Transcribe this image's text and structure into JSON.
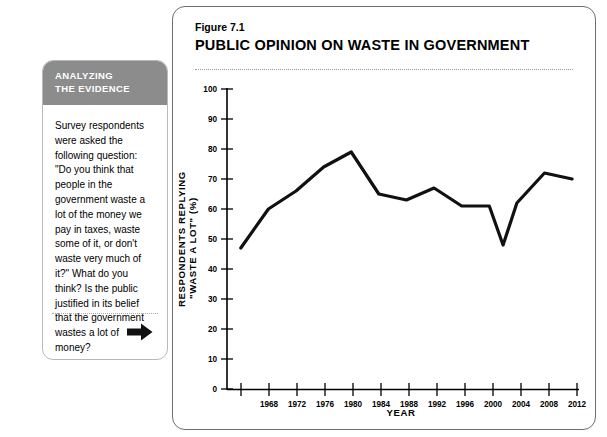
{
  "sidebar": {
    "header_line1": "ANALYZING",
    "header_line2": "THE EVIDENCE",
    "body": "Survey respondents were asked the following question: \"Do you think that people in the government waste a lot of the money we pay in taxes, waste some of it, or don't waste very much of it?\" What do you think? Is the public justified in its belief that the government wastes a lot of money?",
    "arrow_icon": "right-arrow-icon",
    "header_bg": "#8c8c8c",
    "border_color": "#b9b9b9"
  },
  "figure": {
    "number": "Figure 7.1",
    "title": "PUBLIC OPINION ON WASTE IN GOVERNMENT",
    "border_color": "#6e6e6e"
  },
  "chart_data": {
    "type": "line",
    "title": "PUBLIC OPINION ON WASTE IN GOVERNMENT",
    "xlabel": "YEAR",
    "ylabel": "RESPONDENTS REPLYING \"WASTE A LOT\" (%)",
    "ylabel_line1": "RESPONDENTS REPLYING",
    "ylabel_line2": "\"WASTE A LOT\" (%)",
    "xlim": [
      1962,
      2013
    ],
    "ylim": [
      0,
      100
    ],
    "ytick_values": [
      0,
      10,
      20,
      30,
      40,
      50,
      60,
      70,
      80,
      90,
      100
    ],
    "ytick_labels": [
      "0",
      "10",
      "20",
      "30",
      "40",
      "50",
      "60",
      "70",
      "80",
      "90",
      "100"
    ],
    "xtick_values": [
      1964,
      1968,
      1972,
      1976,
      1980,
      1984,
      1988,
      1992,
      1996,
      2000,
      2004,
      2008,
      2012
    ],
    "xtick_labels": [
      "",
      "1968",
      "1972",
      "1976",
      "1980",
      "1984",
      "1988",
      "1992",
      "1996",
      "2000",
      "2004",
      "2008",
      "2012"
    ],
    "grid": false,
    "legend": null,
    "line_color": "#111111",
    "x": [
      1964,
      1968,
      1972,
      1976,
      1980,
      1984,
      1988,
      1992,
      1996,
      2000,
      2002,
      2004,
      2008,
      2012
    ],
    "values": [
      47,
      60,
      66,
      74,
      79,
      65,
      63,
      67,
      61,
      61,
      48,
      62,
      72,
      70
    ],
    "series": [
      {
        "name": "Waste a lot",
        "x": [
          1964,
          1968,
          1972,
          1976,
          1980,
          1984,
          1988,
          1992,
          1996,
          2000,
          2002,
          2004,
          2008,
          2012
        ],
        "values": [
          47,
          60,
          66,
          74,
          79,
          65,
          63,
          67,
          61,
          61,
          48,
          62,
          72,
          70
        ]
      }
    ]
  }
}
